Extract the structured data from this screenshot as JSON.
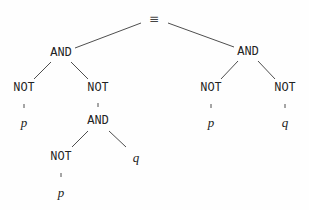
{
  "diagram": {
    "type": "expression-tree",
    "colors": {
      "text": "#222222",
      "edge": "#3a3a3a",
      "background": "#fefefe"
    },
    "nodes": [
      {
        "id": "n0",
        "label": "≡",
        "kind": "equiv",
        "x": 154,
        "y": 19
      },
      {
        "id": "n1",
        "label": "AND",
        "kind": "op",
        "x": 61,
        "y": 53
      },
      {
        "id": "n2",
        "label": "AND",
        "kind": "op",
        "x": 248,
        "y": 52
      },
      {
        "id": "n3",
        "label": "NOT",
        "kind": "op",
        "x": 24,
        "y": 88
      },
      {
        "id": "n4",
        "label": "NOT",
        "kind": "op",
        "x": 98,
        "y": 88
      },
      {
        "id": "n5",
        "label": "NOT",
        "kind": "op",
        "x": 211,
        "y": 88
      },
      {
        "id": "n6",
        "label": "NOT",
        "kind": "op",
        "x": 285,
        "y": 88
      },
      {
        "id": "n7",
        "label": "p",
        "kind": "var",
        "x": 24,
        "y": 122
      },
      {
        "id": "n8",
        "label": "AND",
        "kind": "op",
        "x": 98,
        "y": 121
      },
      {
        "id": "n9",
        "label": "p",
        "kind": "var",
        "x": 211,
        "y": 122
      },
      {
        "id": "n10",
        "label": "q",
        "kind": "var",
        "x": 285,
        "y": 122
      },
      {
        "id": "n11",
        "label": "NOT",
        "kind": "op",
        "x": 61,
        "y": 157
      },
      {
        "id": "n12",
        "label": "q",
        "kind": "var",
        "x": 136,
        "y": 157
      },
      {
        "id": "n13",
        "label": "p",
        "kind": "var",
        "x": 61,
        "y": 192
      }
    ],
    "edges": [
      {
        "x1": 141,
        "y1": 23,
        "x2": 75,
        "y2": 48
      },
      {
        "x1": 168,
        "y1": 23,
        "x2": 234,
        "y2": 47
      },
      {
        "x1": 51,
        "y1": 62,
        "x2": 34,
        "y2": 79
      },
      {
        "x1": 71,
        "y1": 62,
        "x2": 88,
        "y2": 79
      },
      {
        "x1": 238,
        "y1": 61,
        "x2": 221,
        "y2": 79
      },
      {
        "x1": 258,
        "y1": 61,
        "x2": 275,
        "y2": 79
      },
      {
        "x1": 24,
        "y1": 104,
        "x2": 24,
        "y2": 108
      },
      {
        "x1": 98,
        "y1": 103,
        "x2": 98,
        "y2": 107
      },
      {
        "x1": 211,
        "y1": 104,
        "x2": 211,
        "y2": 108
      },
      {
        "x1": 285,
        "y1": 104,
        "x2": 285,
        "y2": 108
      },
      {
        "x1": 88,
        "y1": 131,
        "x2": 72,
        "y2": 147
      },
      {
        "x1": 109,
        "y1": 131,
        "x2": 126,
        "y2": 147
      },
      {
        "x1": 61,
        "y1": 173,
        "x2": 61,
        "y2": 177
      }
    ]
  }
}
